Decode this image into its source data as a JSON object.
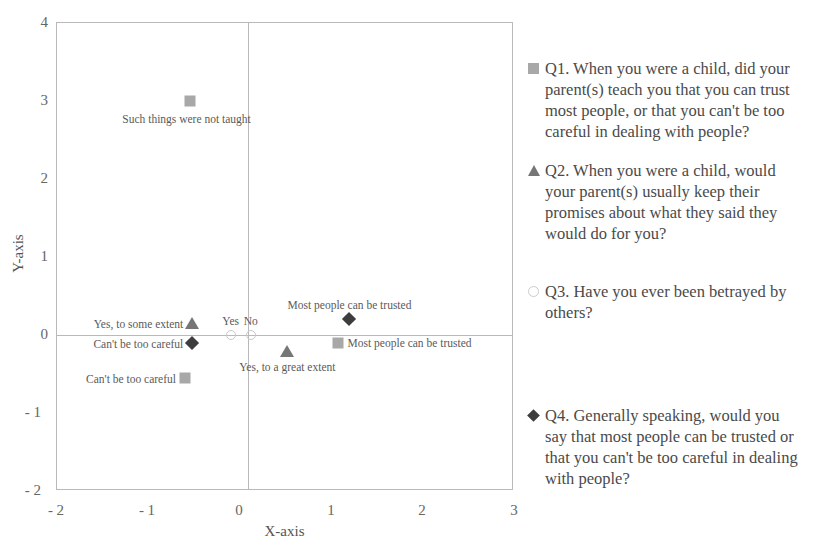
{
  "chart_data": {
    "type": "scatter",
    "title": "",
    "xlabel": "X-axis",
    "ylabel": "Y-axis",
    "xlim": [
      -2,
      3
    ],
    "ylim": [
      -2,
      4
    ],
    "xticks": [
      "- 2",
      "- 1",
      "0",
      "1",
      "2",
      "3"
    ],
    "xtick_values": [
      -2,
      -1,
      0,
      1,
      2,
      3
    ],
    "yticks": [
      "4",
      "3",
      "2",
      "1",
      "0",
      "- 1",
      "- 2"
    ],
    "ytick_values": [
      4,
      3,
      2,
      1,
      0,
      -1,
      -2
    ],
    "grid": "axes-cross-only",
    "gridlines": {
      "vertical_at_x": 0,
      "horizontal_at_y": 0
    },
    "legend_position": "right",
    "series": [
      {
        "name": "Q1",
        "marker": "square",
        "color": "#a8a8a8",
        "legend_label": "Q1. When you were a child, did your parent(s) teach you that you can trust most people, or that you can't be too careful in dealing with people?",
        "points": [
          {
            "x": -0.55,
            "y": 3.0,
            "label": "Such things were not taught",
            "label_pos": "below-left"
          },
          {
            "x": -0.6,
            "y": -0.55,
            "label": "Can't be too careful",
            "label_pos": "left"
          },
          {
            "x": 1.07,
            "y": -0.1,
            "label": "Most people can be trusted",
            "label_pos": "right"
          }
        ]
      },
      {
        "name": "Q2",
        "marker": "triangle",
        "color": "#767676",
        "legend_label": "Q2. When you were a child, would your parent(s) usually keep their promises about what they said they would do for you?",
        "points": [
          {
            "x": -0.52,
            "y": 0.15,
            "label": "Yes, to some extent",
            "label_pos": "left"
          },
          {
            "x": 0.52,
            "y": -0.2,
            "label": "Yes, to a great extent",
            "label_pos": "below"
          }
        ]
      },
      {
        "name": "Q3",
        "marker": "circle-open",
        "color": "#c9c9c9",
        "legend_label": "Q3. Have you ever been betrayed by others?",
        "points": [
          {
            "x": -0.1,
            "y": 0.0,
            "label": "Yes",
            "label_pos": "above"
          },
          {
            "x": 0.12,
            "y": 0.0,
            "label": "No",
            "label_pos": "above"
          }
        ]
      },
      {
        "name": "Q4",
        "marker": "diamond",
        "color": "#3d3d3d",
        "legend_label": "Q4. Generally speaking, would you say that most people can be trusted or that you can't be too careful in dealing with people?",
        "points": [
          {
            "x": -0.52,
            "y": -0.1,
            "label": "Can't be too careful",
            "label_pos": "left"
          },
          {
            "x": 1.2,
            "y": 0.2,
            "label": "Most people can be trusted",
            "label_pos": "above"
          }
        ]
      }
    ]
  },
  "axes": {
    "x_title": "X-axis",
    "y_title": "Y-axis",
    "x_ticks": [
      "- 2",
      "- 1",
      "0",
      "1",
      "2",
      "3"
    ],
    "y_ticks": [
      "4",
      "3",
      "2",
      "1",
      "0",
      "- 1",
      "- 2"
    ]
  },
  "legend": {
    "entries": [
      {
        "marker": "square",
        "text": "Q1. When you were a child, did your parent(s) teach you that you can trust most people, or that you can't be too careful in dealing with people?"
      },
      {
        "marker": "triangle",
        "text": "Q2. When you were a child, would your parent(s) usually keep their promises about what they said they would do for you?"
      },
      {
        "marker": "circle-open",
        "text": "Q3. Have you ever been betrayed by others?"
      },
      {
        "marker": "diamond",
        "text": "Q4. Generally speaking, would you say that most people can be trusted or that you can't be too careful in dealing with people?"
      }
    ]
  },
  "point_labels": {
    "q1_a": "Such things were not taught",
    "q1_b": "Can't be too careful",
    "q1_c": "Most people can be trusted",
    "q2_a": "Yes, to some extent",
    "q2_b": "Yes, to a great extent",
    "q3_a": "Yes",
    "q3_b": "No",
    "q4_a": "Can't be too careful",
    "q4_b": "Most people can be trusted"
  }
}
